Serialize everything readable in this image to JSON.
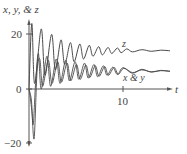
{
  "chart_data": {
    "type": "line",
    "title": "",
    "ylabel": "x, y, & z",
    "xlabel": "t",
    "xlim": [
      0,
      15
    ],
    "ylim": [
      -20,
      24
    ],
    "x_ticks": [
      {
        "value": 10,
        "label": "10"
      }
    ],
    "y_ticks": [
      {
        "value": 20,
        "label": "20"
      },
      {
        "value": 0,
        "label": "0"
      },
      {
        "value": -20,
        "label": "−20"
      }
    ],
    "grid": false,
    "legend": "inline annotations",
    "annotations": [
      {
        "text": "z",
        "t": 10.6,
        "y": 16
      },
      {
        "text": "x & y",
        "t": 9.6,
        "y": 4.5
      }
    ],
    "series": [
      {
        "name": "z",
        "description": "damped oscillation settling near 14",
        "equilibrium": 14,
        "initial_peak": 24,
        "points": [
          [
            0,
            0
          ],
          [
            0.3,
            24
          ],
          [
            0.6,
            2
          ],
          [
            1.3,
            22
          ],
          [
            1.7,
            5
          ],
          [
            2.4,
            20
          ],
          [
            2.8,
            7
          ],
          [
            3.4,
            18
          ],
          [
            3.8,
            9
          ],
          [
            4.4,
            17
          ],
          [
            4.8,
            10
          ],
          [
            5.4,
            16.5
          ],
          [
            5.8,
            11
          ],
          [
            6.4,
            16
          ],
          [
            6.8,
            12
          ],
          [
            7.4,
            15.5
          ],
          [
            7.8,
            12.5
          ],
          [
            8.4,
            15.2
          ],
          [
            8.8,
            13
          ],
          [
            9.4,
            15
          ],
          [
            9.8,
            13.3
          ],
          [
            10.4,
            14.7
          ],
          [
            11,
            13.6
          ],
          [
            12,
            14.4
          ],
          [
            13,
            13.8
          ],
          [
            14,
            14.2
          ],
          [
            15,
            14
          ]
        ]
      },
      {
        "name": "x",
        "description": "damped oscillation settling near 6.5 after initial negative dip",
        "equilibrium": 6.5,
        "initial_min": -13,
        "points": [
          [
            0,
            0
          ],
          [
            0.25,
            -4
          ],
          [
            0.45,
            -13
          ],
          [
            0.7,
            2
          ],
          [
            1.0,
            13
          ],
          [
            1.3,
            0
          ],
          [
            1.9,
            12
          ],
          [
            2.3,
            1
          ],
          [
            2.9,
            11
          ],
          [
            3.3,
            2
          ],
          [
            3.9,
            10.5
          ],
          [
            4.3,
            3
          ],
          [
            4.9,
            10
          ],
          [
            5.3,
            3.5
          ],
          [
            5.9,
            9.5
          ],
          [
            6.3,
            4
          ],
          [
            6.9,
            9
          ],
          [
            7.3,
            4.5
          ],
          [
            7.9,
            8.5
          ],
          [
            8.3,
            5
          ],
          [
            8.9,
            8
          ],
          [
            9.4,
            5.3
          ],
          [
            10,
            7.8
          ],
          [
            11,
            5.8
          ],
          [
            12,
            7.2
          ],
          [
            13,
            6.2
          ],
          [
            14,
            6.8
          ],
          [
            15,
            6.5
          ]
        ]
      },
      {
        "name": "y",
        "description": "similar to x, slightly phase shifted",
        "equilibrium": 6.5,
        "initial_min": -18,
        "points": [
          [
            0,
            0
          ],
          [
            0.3,
            -8
          ],
          [
            0.55,
            -18
          ],
          [
            0.85,
            6
          ],
          [
            1.15,
            11
          ],
          [
            1.45,
            1
          ],
          [
            2.05,
            10.5
          ],
          [
            2.45,
            2
          ],
          [
            3.05,
            10
          ],
          [
            3.45,
            2.5
          ],
          [
            4.05,
            9.5
          ],
          [
            4.45,
            3
          ],
          [
            5.05,
            9
          ],
          [
            5.45,
            3.5
          ],
          [
            6.05,
            8.8
          ],
          [
            6.45,
            4.2
          ],
          [
            7.05,
            8.5
          ],
          [
            7.45,
            4.6
          ],
          [
            8.05,
            8.2
          ],
          [
            8.45,
            5
          ],
          [
            9.05,
            7.9
          ],
          [
            9.5,
            5.4
          ],
          [
            10.1,
            7.6
          ],
          [
            11,
            6
          ],
          [
            12,
            7
          ],
          [
            13,
            6.3
          ],
          [
            14,
            6.7
          ],
          [
            15,
            6.5
          ]
        ]
      }
    ]
  },
  "axes": {
    "y_label": "x, y, & z",
    "x_label": "t",
    "y_tick_labels": [
      "20",
      "0",
      "−20"
    ],
    "x_tick_labels": [
      "10"
    ],
    "z_annotation": "z",
    "xy_annotation": "x & y"
  },
  "colors": {
    "axis": "#555555",
    "line": "#4a4a4a",
    "text": "#444444",
    "background": "#ffffff"
  }
}
